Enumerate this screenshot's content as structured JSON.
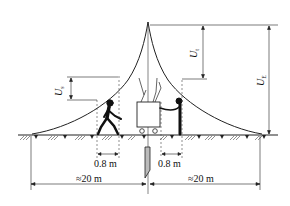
{
  "diagram": {
    "labels": {
      "step_voltage": {
        "symbol": "U",
        "subscript": "s"
      },
      "touch_voltage": {
        "symbol": "U",
        "subscript": "t"
      },
      "earth_potential": {
        "symbol": "U",
        "subscript": "E"
      }
    },
    "dimensions": {
      "step_distance": "0.8 m",
      "touch_distance": "0.8 m",
      "left_span": "≈20 m",
      "right_span": "≈20 m"
    },
    "elements": [
      "potential-curve",
      "ground-line",
      "walking-person",
      "equipment-box",
      "touching-person",
      "ground-electrode"
    ]
  }
}
